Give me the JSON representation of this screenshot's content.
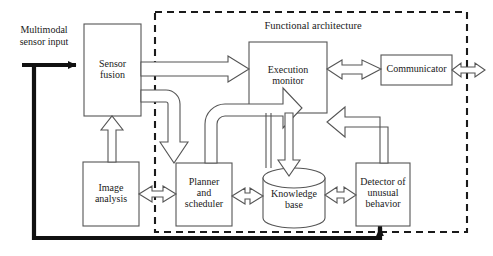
{
  "diagram": {
    "title": "Functional architecture",
    "external_input_label": "Multimodal\nsensor input",
    "boundary": {
      "name": "functional-architecture-boundary",
      "style": "dashed",
      "color": "#1a1a1a"
    },
    "nodes": [
      {
        "id": "sensor-fusion",
        "label": "Sensor\nfusion",
        "shape": "rectangle",
        "x": 84,
        "y": 24,
        "w": 57,
        "h": 92
      },
      {
        "id": "execution-monitor",
        "label": "Execution\nmonitor",
        "shape": "rectangle",
        "x": 249,
        "y": 42,
        "w": 78,
        "h": 71
      },
      {
        "id": "communicator",
        "label": "Communicator",
        "shape": "rectangle",
        "x": 381,
        "y": 55,
        "w": 71,
        "h": 30
      },
      {
        "id": "image-analysis",
        "label": "Image\nanalysis",
        "shape": "rectangle",
        "x": 83,
        "y": 162,
        "w": 56,
        "h": 64
      },
      {
        "id": "planner-and-scheduler",
        "label": "Planner\nand\nscheduler",
        "shape": "rectangle",
        "x": 176,
        "y": 163,
        "w": 56,
        "h": 63
      },
      {
        "id": "knowledge-base",
        "label": "Knowledge\nbase",
        "shape": "cylinder",
        "x": 263,
        "y": 168,
        "w": 62,
        "h": 60
      },
      {
        "id": "detector-of-unusual-behavior",
        "label": "Detector of\nunusual\nbehavior",
        "shape": "rectangle",
        "x": 356,
        "y": 163,
        "w": 54,
        "h": 63
      }
    ],
    "edges": [
      {
        "id": "input-to-sensor-fusion",
        "from": "external-input",
        "to": "sensor-fusion",
        "style": "thick-solid",
        "direction": "one-way"
      },
      {
        "id": "sensor-fusion-to-execution-monitor",
        "from": "sensor-fusion",
        "to": "execution-monitor",
        "style": "hollow-block",
        "direction": "one-way"
      },
      {
        "id": "sensor-fusion-to-planner",
        "from": "sensor-fusion",
        "to": "planner-and-scheduler",
        "style": "hollow-curved",
        "direction": "one-way"
      },
      {
        "id": "planner-to-execution-monitor",
        "from": "planner-and-scheduler",
        "to": "execution-monitor",
        "style": "hollow-curved",
        "direction": "one-way"
      },
      {
        "id": "image-analysis-to-sensor-fusion",
        "from": "image-analysis",
        "to": "sensor-fusion",
        "style": "hollow-block",
        "direction": "one-way"
      },
      {
        "id": "image-analysis-to-planner",
        "from": "image-analysis",
        "to": "planner-and-scheduler",
        "style": "hollow-block",
        "direction": "two-way"
      },
      {
        "id": "planner-to-knowledge-base",
        "from": "planner-and-scheduler",
        "to": "knowledge-base",
        "style": "hollow-block",
        "direction": "two-way"
      },
      {
        "id": "knowledge-base-to-detector",
        "from": "knowledge-base",
        "to": "detector-of-unusual-behavior",
        "style": "hollow-block",
        "direction": "two-way"
      },
      {
        "id": "execution-monitor-to-knowledge-base",
        "from": "execution-monitor",
        "to": "knowledge-base",
        "style": "hollow-block",
        "direction": "one-way"
      },
      {
        "id": "knowledge-base-to-execution-monitor",
        "from": "knowledge-base",
        "to": "execution-monitor",
        "style": "hollow-block",
        "direction": "one-way"
      },
      {
        "id": "detector-to-execution-monitor",
        "from": "detector-of-unusual-behavior",
        "to": "execution-monitor",
        "style": "hollow-block",
        "direction": "one-way"
      },
      {
        "id": "execution-monitor-to-communicator",
        "from": "execution-monitor",
        "to": "communicator",
        "style": "hollow-block",
        "direction": "two-way"
      },
      {
        "id": "communicator-to-external",
        "from": "communicator",
        "to": "external",
        "style": "hollow-block",
        "direction": "two-way"
      },
      {
        "id": "detector-feedback-to-input",
        "from": "detector-of-unusual-behavior",
        "to": "external-input",
        "style": "thick-solid",
        "direction": "one-way"
      }
    ]
  }
}
